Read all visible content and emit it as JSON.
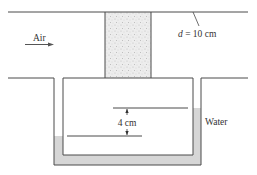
{
  "diagram": {
    "type": "manometer-porous-plug",
    "labels": {
      "air": "Air",
      "diameter": "d = 10 cm",
      "diameter_var": "d",
      "diameter_value": " = 10 cm",
      "height_difference": "4 cm",
      "fluid": "Water"
    },
    "colors": {
      "line": "#4a4a4a",
      "water": "#d6d6d6",
      "plug": "#ececec",
      "plug_speckle": "#b0b0b0",
      "text": "#333333"
    }
  }
}
